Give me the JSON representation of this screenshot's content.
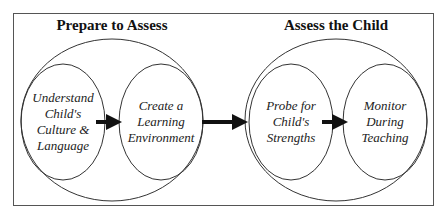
{
  "groups": [
    {
      "title": "Prepare to Assess",
      "steps": [
        {
          "lines": [
            "Understand",
            "Child's",
            "Culture &",
            "Language"
          ]
        },
        {
          "lines": [
            "Create a",
            "Learning",
            "Environment"
          ]
        }
      ]
    },
    {
      "title": "Assess the Child",
      "steps": [
        {
          "lines": [
            "Probe for",
            "Child's",
            "Strengths"
          ]
        },
        {
          "lines": [
            "Monitor",
            "During",
            "Teaching"
          ]
        }
      ]
    }
  ]
}
